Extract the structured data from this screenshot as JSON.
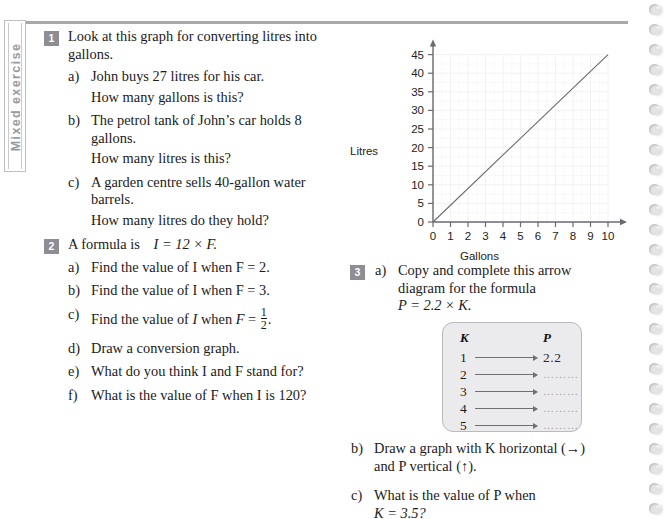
{
  "sidetab": {
    "label": "Mixed exercise"
  },
  "questions": [
    {
      "number": "1",
      "stem": "Look at this graph for converting litres into gallons.",
      "parts": [
        {
          "label": "a)",
          "text": "John buys 27 litres for his car.",
          "sub": "How many gallons is this?"
        },
        {
          "label": "b)",
          "text": "The petrol tank of John’s car holds 8 gallons.",
          "sub": "How many litres is this?"
        },
        {
          "label": "c)",
          "text": "A garden centre sells 40-gallon water barrels.",
          "sub": "How many litres do they hold?"
        }
      ]
    },
    {
      "number": "2",
      "stem_prefix": "A formula is",
      "stem_formula": "I = 12 × F.",
      "parts": [
        {
          "label": "a)",
          "text": "Find the value of I when F = 2."
        },
        {
          "label": "b)",
          "text": "Find the value of I when F = 3."
        },
        {
          "label": "c)",
          "text_pre": "Find the value of ",
          "ital1": "I",
          "text_mid": " when ",
          "ital2": "F",
          "text_eq": " = ",
          "frac_num": "1",
          "frac_den": "2",
          "text_post": "."
        },
        {
          "label": "d)",
          "text": "Draw a conversion graph."
        },
        {
          "label": "e)",
          "text": "What do you think I and F stand for?"
        },
        {
          "label": "f)",
          "text": "What is the value of F when I is 120?"
        }
      ]
    },
    {
      "number": "3",
      "parts": [
        {
          "label": "a)",
          "line1": "Copy and complete this arrow",
          "line2": "diagram for the formula",
          "line3": "P = 2.2 × K."
        },
        {
          "label": "b)",
          "line1": "Draw a graph with K horizontal (→)",
          "line2": "and P vertical (↑)."
        },
        {
          "label": "c)",
          "line1": "What is the value of P when",
          "line2": "K = 3.5?"
        }
      ]
    }
  ],
  "arrow_diagram": {
    "header_left": "K",
    "header_right": "P",
    "rows": [
      {
        "k": "1",
        "p": "2.2",
        "filled": true
      },
      {
        "k": "2",
        "p": "………",
        "filled": false
      },
      {
        "k": "3",
        "p": "………",
        "filled": false
      },
      {
        "k": "4",
        "p": "………",
        "filled": false
      },
      {
        "k": "5",
        "p": "………",
        "filled": false
      }
    ]
  },
  "chart_data": {
    "type": "line",
    "title": "",
    "xlabel": "Gallons",
    "ylabel": "Litres",
    "xlim": [
      0,
      10
    ],
    "ylim": [
      0,
      45
    ],
    "x_ticks": [
      0,
      1,
      2,
      3,
      4,
      5,
      6,
      7,
      8,
      9,
      10
    ],
    "y_ticks": [
      0,
      5,
      10,
      15,
      20,
      25,
      30,
      35,
      40,
      45
    ],
    "grid": true,
    "legend": "none",
    "series": [
      {
        "name": "litres per gallon",
        "x": [
          0,
          10
        ],
        "y": [
          0,
          45
        ]
      }
    ],
    "line_color": "#6a6a70",
    "axis_color": "#6a6a70",
    "grid_color": "#f0f0f3",
    "tick_font_size": 11.5
  },
  "colors": {
    "badge": "#8d8d93",
    "rule": "#a9a9ad",
    "sidetab_text": "#9a9aa0",
    "box_fill": "#ebebee",
    "box_border": "#b9b9be"
  },
  "spiral": {
    "ring_count": 26
  }
}
